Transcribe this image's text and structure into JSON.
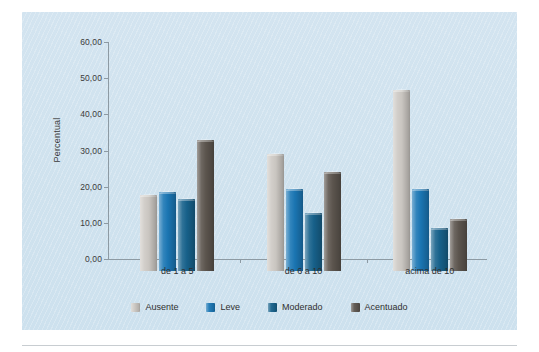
{
  "chart_data": {
    "type": "bar",
    "title": "",
    "xlabel": "",
    "ylabel": "Percentual",
    "categories": [
      "de 1 a 5",
      "de 6 a 10",
      "acima de 10"
    ],
    "series": [
      {
        "name": "Ausente",
        "color": "#cdc9c4",
        "values": [
          21.0,
          32.3,
          50.0
        ]
      },
      {
        "name": "Leve",
        "color": "#1b77b5",
        "values": [
          21.8,
          22.6,
          22.7
        ]
      },
      {
        "name": "Moderado",
        "color": "#17628c",
        "values": [
          20.0,
          16.0,
          12.0
        ]
      },
      {
        "name": "Acentuado",
        "color": "#5d564f",
        "values": [
          36.2,
          27.3,
          14.3
        ]
      }
    ],
    "ylim": [
      0,
      60
    ],
    "ytick_labels": [
      "0,00",
      "10,00",
      "20,00",
      "30,00",
      "40,00",
      "50,00",
      "60,00"
    ],
    "ytick_values": [
      0,
      10,
      20,
      30,
      40,
      50,
      60
    ],
    "grid": false,
    "legend_position": "bottom",
    "panel_color": "#cfe2ee"
  }
}
